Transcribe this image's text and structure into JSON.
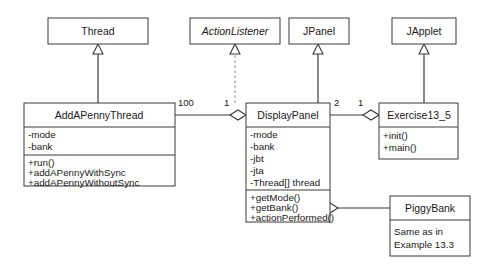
{
  "diagram": {
    "classes": {
      "thread": {
        "name": "Thread",
        "stereotype": "class"
      },
      "action_listener": {
        "name": "ActionListener",
        "stereotype": "interface"
      },
      "jpanel": {
        "name": "JPanel",
        "stereotype": "class"
      },
      "japplet": {
        "name": "JApplet",
        "stereotype": "class"
      },
      "add_a_penny_thread": {
        "name": "AddAPennyThread",
        "stereotype": "class",
        "attributes": [
          "-mode",
          "-bank"
        ],
        "methods": [
          "+run()",
          "+addAPennyWithSync",
          "+addAPennyWithoutSync"
        ]
      },
      "display_panel": {
        "name": "DisplayPanel",
        "stereotype": "class",
        "attributes": [
          "-mode",
          "-bank",
          "-jbt",
          "-jta",
          "-Thread[] thread"
        ],
        "methods": [
          "+getMode()",
          "+getBank()",
          "+actionPerformed()"
        ]
      },
      "exercise": {
        "name": "Exercise13_5",
        "stereotype": "class",
        "methods": [
          "+init()",
          "+main()"
        ]
      },
      "piggy_bank": {
        "name": "PiggyBank",
        "stereotype": "class",
        "note": [
          "Same as in",
          "Example 13.3"
        ]
      }
    },
    "multiplicities": {
      "thread_side": "100",
      "panel_left": "1",
      "panel_right": "2",
      "exercise_side": "1"
    },
    "relations": [
      {
        "id": "thread-inherit",
        "type": "generalization",
        "from": "AddAPennyThread",
        "to": "Thread"
      },
      {
        "id": "actionlistener-realize",
        "type": "realization",
        "from": "DisplayPanel",
        "to": "ActionListener"
      },
      {
        "id": "jpanel-inherit",
        "type": "generalization",
        "from": "DisplayPanel",
        "to": "JPanel"
      },
      {
        "id": "japplet-inherit",
        "type": "generalization",
        "from": "Exercise13_5",
        "to": "JApplet"
      },
      {
        "id": "panel-thread-aggregation",
        "type": "aggregation",
        "from": "DisplayPanel",
        "to": "AddAPennyThread"
      },
      {
        "id": "exercise-panel-aggregation",
        "type": "aggregation",
        "from": "Exercise13_5",
        "to": "DisplayPanel"
      },
      {
        "id": "panel-piggybank-aggregation",
        "type": "aggregation",
        "from": "DisplayPanel",
        "to": "PiggyBank"
      }
    ]
  }
}
